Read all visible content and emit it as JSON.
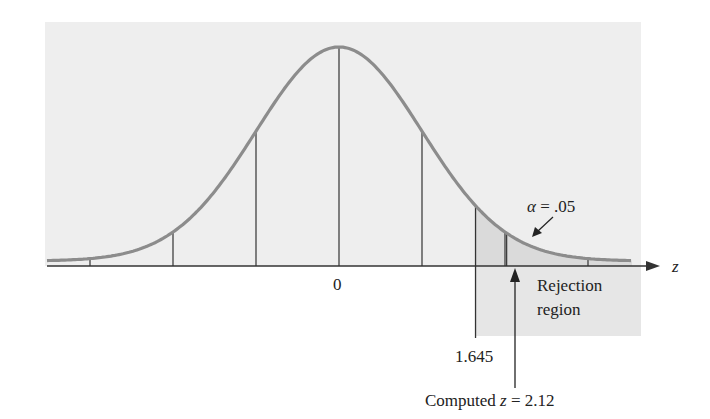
{
  "chart_data": {
    "type": "area",
    "title": "",
    "xlabel": "z",
    "ylabel": "",
    "x_axis": {
      "center_label": "0",
      "tick_sigma_positions": [
        -3,
        -2,
        -1,
        0,
        1,
        2,
        3
      ]
    },
    "grid": false,
    "distribution": {
      "mean": 0,
      "sd": 1
    },
    "critical_value": 1.645,
    "critical_value_label": "1.645",
    "computed_z": 2.12,
    "computed_label_prefix": "Computed ",
    "computed_label_var": "z",
    "computed_label_suffix": " = 2.12",
    "alpha_label_symbol": "α",
    "alpha_label_value": " = .05",
    "alpha": 0.05,
    "rejection_label_line1": "Rejection",
    "rejection_label_line2": "region",
    "shaded_region": {
      "from": 1.645,
      "to": "∞",
      "side": "right"
    }
  },
  "colors": {
    "background_panel": "#eeeeee",
    "rejection_fill": "#dadada",
    "curve": "#8c8c8c",
    "axis": "#333333",
    "text": "#222222"
  }
}
